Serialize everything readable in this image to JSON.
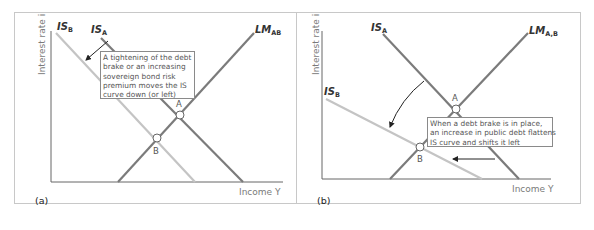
{
  "panels": [
    {
      "id": "a",
      "tag": "(a)",
      "y_axis_label": "Interest rate i",
      "x_axis_label": "Income Y",
      "curves": {
        "is_b": {
          "name": "IS",
          "sub": "B",
          "color": "#c4c4c4"
        },
        "is_a": {
          "name": "IS",
          "sub": "A",
          "color": "#7b7b7b"
        },
        "lm": {
          "name": "LM",
          "sub": "AB",
          "color": "#7b7b7b"
        }
      },
      "points": {
        "a": "A",
        "b": "B"
      },
      "note_lines": [
        "A tightening of the debt",
        "brake or an increasing",
        "sovereign bond risk",
        "premium moves the IS",
        "curve down (or left)"
      ]
    },
    {
      "id": "b",
      "tag": "(b)",
      "y_axis_label": "Interest rate i",
      "x_axis_label": "Income Y",
      "curves": {
        "is_a": {
          "name": "IS",
          "sub": "A",
          "color": "#7b7b7b"
        },
        "is_b": {
          "name": "IS",
          "sub": "B",
          "color": "#c4c4c4"
        },
        "lm": {
          "name": "LM",
          "sub": "A,B",
          "color": "#7b7b7b"
        }
      },
      "points": {
        "a": "A",
        "b": "B"
      },
      "note_lines": [
        "When a debt brake is in place,",
        "an increase in public debt flattens",
        "IS curve and shifts it left"
      ]
    }
  ]
}
